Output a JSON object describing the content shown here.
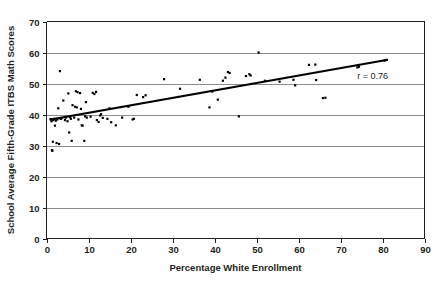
{
  "chart_data": {
    "type": "scatter",
    "title": "",
    "subtitle": "",
    "xlabel": "Percentage White Enrollment",
    "ylabel": "School Average Fifth-Grade ITBS Math Scores",
    "xlim": [
      0,
      90
    ],
    "ylim": [
      0,
      70
    ],
    "xticks": [
      0,
      10,
      20,
      30,
      40,
      50,
      60,
      70,
      80,
      90
    ],
    "yticks": [
      0,
      10,
      20,
      30,
      40,
      50,
      60,
      70
    ],
    "xtick_labels": [
      "0",
      "10",
      "20",
      "30",
      "40",
      "50",
      "60",
      "70",
      "80",
      "90"
    ],
    "ytick_labels": [
      "0",
      "10",
      "20",
      "30",
      "40",
      "50",
      "60",
      "70"
    ],
    "grid": "horizontal",
    "legend": "none",
    "annotations": [
      {
        "text": "r = 0.76",
        "x": 74,
        "y": 51.5
      }
    ],
    "trend_line": {
      "type": "linear-fit",
      "x_start": 1.0,
      "y_start": 38.4,
      "x_end": 81.0,
      "y_end": 57.6
    },
    "marker": {
      "shape": "square",
      "color": "#000000",
      "size_px": 2.2
    },
    "points": [
      [
        1.0,
        38.5
      ],
      [
        1.2,
        37.8
      ],
      [
        1.3,
        28.5
      ],
      [
        1.4,
        28.3
      ],
      [
        1.5,
        31.2
      ],
      [
        1.6,
        38.2
      ],
      [
        1.8,
        38.6
      ],
      [
        2.0,
        36.4
      ],
      [
        2.2,
        38.0
      ],
      [
        2.4,
        30.8
      ],
      [
        2.6,
        38.4
      ],
      [
        2.8,
        42.0
      ],
      [
        3.0,
        30.5
      ],
      [
        3.2,
        54.0
      ],
      [
        3.4,
        38.6
      ],
      [
        3.6,
        38.8
      ],
      [
        4.0,
        44.5
      ],
      [
        4.4,
        38.2
      ],
      [
        4.6,
        39.0
      ],
      [
        5.0,
        37.8
      ],
      [
        5.2,
        46.8
      ],
      [
        5.4,
        34.2
      ],
      [
        5.6,
        39.2
      ],
      [
        5.8,
        38.6
      ],
      [
        6.0,
        31.5
      ],
      [
        6.2,
        43.0
      ],
      [
        6.6,
        39.0
      ],
      [
        6.8,
        42.5
      ],
      [
        7.0,
        47.5
      ],
      [
        7.2,
        42.3
      ],
      [
        7.4,
        47.2
      ],
      [
        7.6,
        38.4
      ],
      [
        8.0,
        46.9
      ],
      [
        8.2,
        41.8
      ],
      [
        8.4,
        36.5
      ],
      [
        8.6,
        36.4
      ],
      [
        9.0,
        31.5
      ],
      [
        9.2,
        39.4
      ],
      [
        9.4,
        44.0
      ],
      [
        9.6,
        39.0
      ],
      [
        10.5,
        39.3
      ],
      [
        11.0,
        47.0
      ],
      [
        11.4,
        46.6
      ],
      [
        11.8,
        47.3
      ],
      [
        12.0,
        38.2
      ],
      [
        12.4,
        37.6
      ],
      [
        12.8,
        39.7
      ],
      [
        13.0,
        40.1
      ],
      [
        13.4,
        38.9
      ],
      [
        14.5,
        38.6
      ],
      [
        15.0,
        42.0
      ],
      [
        15.4,
        37.5
      ],
      [
        16.5,
        36.5
      ],
      [
        18.0,
        39.0
      ],
      [
        19.5,
        42.5
      ],
      [
        20.5,
        38.4
      ],
      [
        20.8,
        38.6
      ],
      [
        21.5,
        46.3
      ],
      [
        23.0,
        45.6
      ],
      [
        23.6,
        46.2
      ],
      [
        28.0,
        51.4
      ],
      [
        31.8,
        48.3
      ],
      [
        36.5,
        51.2
      ],
      [
        38.8,
        42.3
      ],
      [
        39.5,
        47.4
      ],
      [
        40.8,
        44.8
      ],
      [
        42.0,
        50.9
      ],
      [
        42.6,
        51.9
      ],
      [
        43.2,
        53.7
      ],
      [
        43.6,
        53.4
      ],
      [
        45.8,
        39.4
      ],
      [
        47.5,
        52.4
      ],
      [
        48.3,
        53.0
      ],
      [
        48.6,
        52.6
      ],
      [
        50.5,
        60.0
      ],
      [
        52.0,
        50.9
      ],
      [
        55.5,
        50.6
      ],
      [
        58.8,
        51.2
      ],
      [
        59.2,
        49.4
      ],
      [
        62.5,
        56.0
      ],
      [
        64.0,
        56.1
      ],
      [
        64.2,
        51.1
      ],
      [
        65.8,
        45.3
      ],
      [
        66.4,
        45.4
      ],
      [
        74.0,
        55.2
      ],
      [
        74.4,
        55.4
      ],
      [
        80.5,
        57.4
      ],
      [
        81.0,
        57.6
      ]
    ]
  },
  "axes": {
    "x_axis_title": "Percentage White Enrollment",
    "y_axis_title": "School Average Fifth-Grade ITBS Math Scores"
  },
  "colors": {
    "marker": "#000000",
    "trend": "#000000",
    "grid": "#8d8d8d",
    "axis": "#231f20",
    "background": "#ffffff"
  }
}
